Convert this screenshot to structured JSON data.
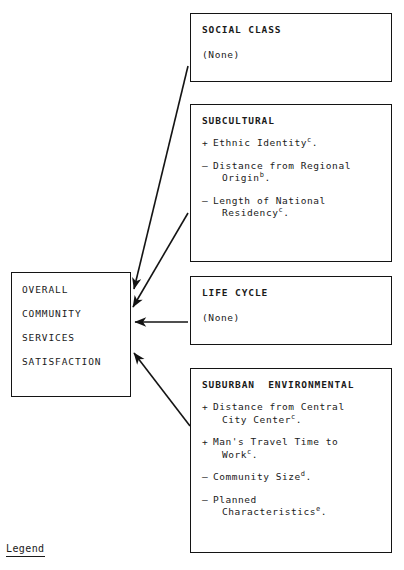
{
  "diagram": {
    "outcome": {
      "lines": [
        "OVERALL",
        "COMMUNITY",
        "SERVICES",
        "SATISFACTION"
      ]
    },
    "boxes": [
      {
        "id": "social-class",
        "title": "SOCIAL CLASS",
        "none_label": "(None)",
        "items": []
      },
      {
        "id": "subcultural",
        "title": "SUBCULTURAL",
        "none_label": "",
        "items": [
          {
            "sign": "+",
            "text": "Ethnic Identity",
            "sup": "c",
            "tail": ".",
            "line2": ""
          },
          {
            "sign": "–",
            "text": "Distance from Regional",
            "sup": "b",
            "tail": ".",
            "line2": "Origin"
          },
          {
            "sign": "–",
            "text": "Length of National",
            "sup": "c",
            "tail": ".",
            "line2": "Residency"
          }
        ]
      },
      {
        "id": "life-cycle",
        "title": "LIFE CYCLE",
        "none_label": "(None)",
        "items": []
      },
      {
        "id": "suburban",
        "title": "SUBURBAN  ENVIRONMENTAL",
        "none_label": "",
        "items": [
          {
            "sign": "+",
            "text": "Distance from Central",
            "sup": "c",
            "tail": ".",
            "line2": "City Center"
          },
          {
            "sign": "+",
            "text": "Man's Travel Time to",
            "sup": "c",
            "tail": ".",
            "line2": "Work"
          },
          {
            "sign": "–",
            "text": "Community Size",
            "sup": "d",
            "tail": ".",
            "line2": ""
          },
          {
            "sign": "–",
            "text": "Planned",
            "sup": "e",
            "tail": ".",
            "line2": "Characteristics"
          }
        ]
      }
    ],
    "legend": {
      "label": "Legend"
    },
    "colors": {
      "ink": "#141414",
      "paper": "#ffffff"
    }
  }
}
